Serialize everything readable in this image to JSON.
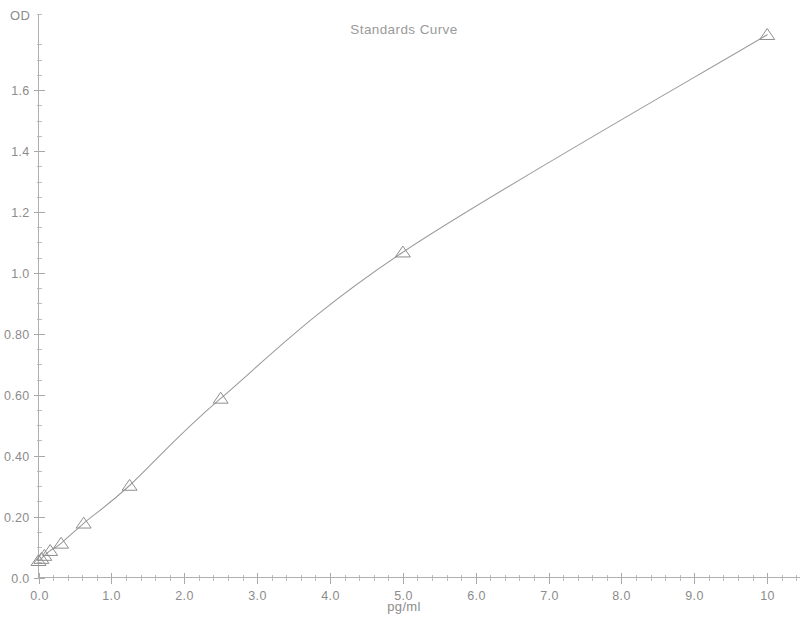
{
  "chart_data": {
    "type": "scatter",
    "title": "Standards Curve",
    "xlabel": "pg/ml",
    "ylabel": "OD",
    "xlim": [
      0,
      10.45
    ],
    "ylim": [
      0,
      1.85
    ],
    "grid": false,
    "legend": "none",
    "marker": "triangle-up",
    "x": [
      0.0,
      0.04,
      0.08,
      0.16,
      0.31,
      0.62,
      1.25,
      2.5,
      5.0,
      10.0
    ],
    "values": [
      0.055,
      0.062,
      0.072,
      0.088,
      0.112,
      0.178,
      0.302,
      0.588,
      1.068,
      1.782
    ],
    "series": [
      {
        "name": "Standards",
        "points": [
          {
            "x": 0.0,
            "y": 0.055
          },
          {
            "x": 0.04,
            "y": 0.062
          },
          {
            "x": 0.08,
            "y": 0.072
          },
          {
            "x": 0.16,
            "y": 0.088
          },
          {
            "x": 0.31,
            "y": 0.112
          },
          {
            "x": 0.62,
            "y": 0.178
          },
          {
            "x": 1.25,
            "y": 0.302
          },
          {
            "x": 2.5,
            "y": 0.588
          },
          {
            "x": 5.0,
            "y": 1.068
          },
          {
            "x": 10.0,
            "y": 1.782
          }
        ]
      }
    ],
    "x_ticks": [
      {
        "value": 0.0,
        "label": "0.0"
      },
      {
        "value": 1.0,
        "label": "1.0"
      },
      {
        "value": 2.0,
        "label": "2.0"
      },
      {
        "value": 3.0,
        "label": "3.0"
      },
      {
        "value": 4.0,
        "label": "4.0"
      },
      {
        "value": 5.0,
        "label": "5.0"
      },
      {
        "value": 6.0,
        "label": "6.0"
      },
      {
        "value": 7.0,
        "label": "7.0"
      },
      {
        "value": 8.0,
        "label": "8.0"
      },
      {
        "value": 9.0,
        "label": "9.0"
      },
      {
        "value": 10.0,
        "label": "10"
      }
    ],
    "y_ticks": [
      {
        "value": 0.0,
        "label": "0.0"
      },
      {
        "value": 0.2,
        "label": "0.20"
      },
      {
        "value": 0.4,
        "label": "0.40"
      },
      {
        "value": 0.6,
        "label": "0.60"
      },
      {
        "value": 0.8,
        "label": "0.80"
      },
      {
        "value": 1.0,
        "label": "1.0"
      },
      {
        "value": 1.2,
        "label": "1.2"
      },
      {
        "value": 1.4,
        "label": "1.4"
      },
      {
        "value": 1.6,
        "label": "1.6"
      }
    ],
    "x_minor_per_major": 5,
    "y_minor_per_major": 4,
    "colors": {
      "axis": "#b0b0b0",
      "curve": "#9a9a9a",
      "marker": "#8e8e8e",
      "text": "#8c8c8c",
      "background": "#ffffff"
    }
  }
}
